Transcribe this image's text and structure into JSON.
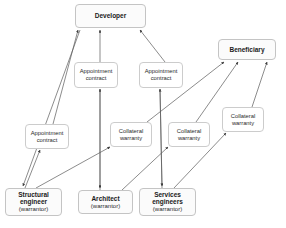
{
  "diagram": {
    "type": "relationship-diagram",
    "colors": {
      "box_fill": "#fcfcfc",
      "box_border": "#c9c9c9",
      "edge": "#555555",
      "text": "#1a1a1a",
      "background": "#ffffff"
    },
    "nodes": [
      {
        "id": "developer",
        "kind": "entity",
        "line1": "Developer",
        "line2": "",
        "x": 75,
        "y": 4,
        "w": 71,
        "h": 24
      },
      {
        "id": "beneficiary",
        "kind": "entity",
        "line1": "Beneficiary",
        "line2": "",
        "x": 218,
        "y": 39,
        "w": 58,
        "h": 21
      },
      {
        "id": "structural-engineer",
        "kind": "entity",
        "line1": "Structural",
        "line1b": "engineer",
        "line2": "(warrantor)",
        "x": 5,
        "y": 188,
        "w": 57,
        "h": 28
      },
      {
        "id": "architect",
        "kind": "entity",
        "line1": "Architect",
        "line1b": "",
        "line2": "(warrantor)",
        "x": 78,
        "y": 190,
        "w": 55,
        "h": 24
      },
      {
        "id": "services-engineers",
        "kind": "entity",
        "line1": "Services",
        "line1b": "engineers",
        "line2": "(warrantor)",
        "x": 139,
        "y": 188,
        "w": 57,
        "h": 28
      },
      {
        "id": "appointment-contract-1",
        "kind": "label",
        "line1": "Appointment",
        "line2": "contract",
        "x": 74,
        "y": 62,
        "w": 44,
        "h": 26
      },
      {
        "id": "appointment-contract-2",
        "kind": "label",
        "line1": "Appointment",
        "line2": "contract",
        "x": 139,
        "y": 62,
        "w": 44,
        "h": 26
      },
      {
        "id": "appointment-contract-3",
        "kind": "label",
        "line1": "Appointment",
        "line2": "contract",
        "x": 25,
        "y": 124,
        "w": 44,
        "h": 25
      },
      {
        "id": "collateral-warranty-1",
        "kind": "label",
        "line1": "Collateral",
        "line2": "warranty",
        "x": 110,
        "y": 122,
        "w": 42,
        "h": 25
      },
      {
        "id": "collateral-warranty-2",
        "kind": "label",
        "line1": "Collateral",
        "line2": "warranty",
        "x": 168,
        "y": 122,
        "w": 42,
        "h": 25
      },
      {
        "id": "collateral-warranty-3",
        "kind": "label",
        "line1": "Collateral",
        "line2": "warranty",
        "x": 222,
        "y": 107,
        "w": 42,
        "h": 25
      }
    ],
    "edges": [
      {
        "id": "edge-structural-to-developer",
        "from": "structural-engineer",
        "to": "developer",
        "label": "appointment-contract-3"
      },
      {
        "id": "edge-architect-to-developer",
        "from": "architect",
        "to": "developer",
        "label": "appointment-contract-1"
      },
      {
        "id": "edge-services-to-developer",
        "from": "services-engineers",
        "to": "developer",
        "label": "appointment-contract-2"
      },
      {
        "id": "edge-structural-to-beneficiary",
        "from": "structural-engineer",
        "to": "beneficiary",
        "label": "collateral-warranty-1"
      },
      {
        "id": "edge-architect-to-beneficiary",
        "from": "architect",
        "to": "beneficiary",
        "label": "collateral-warranty-2"
      },
      {
        "id": "edge-services-to-beneficiary",
        "from": "services-engineers",
        "to": "beneficiary",
        "label": "collateral-warranty-3"
      },
      {
        "id": "edge-developer-to-structural",
        "from": "developer",
        "to": "structural-engineer",
        "label": "appointment-contract-3"
      },
      {
        "id": "edge-developer-to-architect",
        "from": "developer",
        "to": "architect",
        "label": "appointment-contract-1"
      },
      {
        "id": "edge-developer-to-services",
        "from": "developer",
        "to": "services-engineers",
        "label": "appointment-contract-2"
      }
    ]
  }
}
